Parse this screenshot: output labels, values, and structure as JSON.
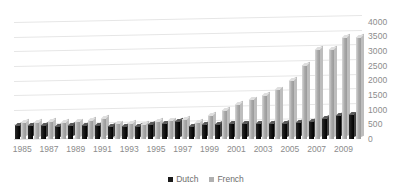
{
  "chart_data": {
    "type": "bar",
    "title": "",
    "subtitle": "",
    "xlabel": "",
    "ylabel": "",
    "ylim": [
      0,
      4000
    ],
    "y_ticks": [
      0,
      500,
      1000,
      1500,
      2000,
      2500,
      3000,
      3500,
      4000
    ],
    "y_axis_position": "right",
    "grid": true,
    "legend_position": "bottom",
    "style": "3d-clustered-column",
    "categories": [
      "1985",
      "1986",
      "1987",
      "1988",
      "1989",
      "1990",
      "1991",
      "1992",
      "1993",
      "1994",
      "1995",
      "1996",
      "1997",
      "1998",
      "1999",
      "2000",
      "2001",
      "2002",
      "2003",
      "2004",
      "2005",
      "2006",
      "2007",
      "2008",
      "2009",
      "2010"
    ],
    "x_tick_labels": [
      "1985",
      "",
      "1987",
      "",
      "1989",
      "",
      "1991",
      "",
      "1993",
      "",
      "1995",
      "",
      "1997",
      "",
      "1999",
      "",
      "2001",
      "",
      "2003",
      "",
      "2005",
      "",
      "2007",
      "",
      "2009",
      ""
    ],
    "series": [
      {
        "name": "Dutch",
        "color": "#1a1a1a",
        "values": [
          470,
          460,
          480,
          440,
          460,
          470,
          480,
          430,
          440,
          430,
          500,
          520,
          600,
          430,
          490,
          510,
          520,
          520,
          520,
          530,
          540,
          560,
          600,
          700,
          800,
          830
        ]
      },
      {
        "name": "French",
        "color": "#b0b0b0",
        "values": [
          560,
          580,
          610,
          560,
          590,
          640,
          700,
          520,
          540,
          500,
          600,
          620,
          680,
          560,
          800,
          980,
          1180,
          1340,
          1500,
          1680,
          2000,
          2520,
          3060,
          3080,
          3470,
          3480
        ]
      }
    ]
  },
  "legend": {
    "items": [
      {
        "label": "Dutch"
      },
      {
        "label": "French"
      }
    ]
  }
}
